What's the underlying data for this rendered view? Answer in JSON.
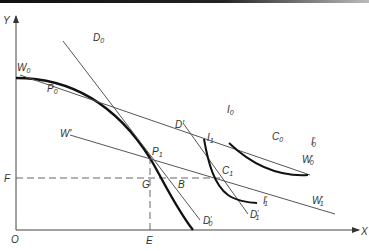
{
  "diagram": {
    "type": "economics-production-possibility-and-indifference",
    "axes": {
      "x_label": "X",
      "y_label": "Y",
      "origin_label": "O"
    },
    "guide_labels": {
      "horizontal": "F",
      "vertical": "E"
    },
    "curves": [
      {
        "id": "ppf",
        "description": "production possibility frontier (bold concave curve)"
      },
      {
        "id": "I0",
        "label": "I",
        "sub": "0",
        "end_label": "I",
        "end_sub": "0",
        "end_prime": "′"
      },
      {
        "id": "I1",
        "label": "I",
        "sub": "1",
        "end_label": "I",
        "end_sub": "1",
        "end_prime": "′"
      }
    ],
    "lines": [
      {
        "id": "W0",
        "label": "W",
        "sub": "0",
        "end_label": "W",
        "end_sub": "0",
        "end_prime": "′"
      },
      {
        "id": "W1",
        "label": "W",
        "sub": "",
        "prime": "′",
        "end_label": "W",
        "end_sub": "1",
        "end_prime": "′"
      },
      {
        "id": "D0",
        "label": "D",
        "sub": "0",
        "end_label": "D",
        "end_sub": "0",
        "end_prime": "′"
      },
      {
        "id": "D1",
        "label": "D",
        "sub": "",
        "prime": "′",
        "end_label": "D",
        "end_sub": "1",
        "end_prime": "′"
      }
    ],
    "points": [
      {
        "label": "P",
        "sub": "0"
      },
      {
        "label": "P",
        "sub": "1"
      },
      {
        "label": "C",
        "sub": "0"
      },
      {
        "label": "C",
        "sub": "1"
      },
      {
        "label": "G",
        "sub": ""
      },
      {
        "label": "B",
        "sub": ""
      }
    ]
  }
}
